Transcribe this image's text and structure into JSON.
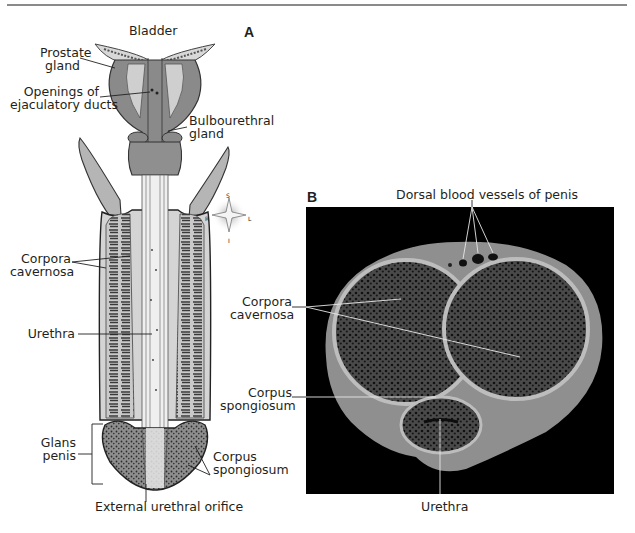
{
  "figure": {
    "panel_a": {
      "letter": "A",
      "labels": {
        "bladder": "Bladder",
        "prostate_1": "Prostate",
        "prostate_2": "gland",
        "openings_1": "Openings of",
        "openings_2": "ejaculatory ducts",
        "bulbo_1": "Bulbourethral",
        "bulbo_2": "gland",
        "corpora_1": "Corpora",
        "corpora_2": "cavernosa",
        "urethra": "Urethra",
        "glans_1": "Glans",
        "glans_2": "penis",
        "spong_1": "Corpus",
        "spong_2": "spongiosum",
        "orifice": "External urethral orifice"
      },
      "compass": {
        "s": "S",
        "i": "I",
        "r": "R",
        "l": "L"
      }
    },
    "panel_b": {
      "letter": "B",
      "labels": {
        "dorsal": "Dorsal blood vessels of penis",
        "corpora_1": "Corpora",
        "corpora_2": "cavernosa",
        "spong_1": "Corpus",
        "spong_2": "spongiosum",
        "urethra": "Urethra"
      }
    }
  },
  "colors": {
    "ink": "#231f20",
    "drawing_fill": "#b9b9b9",
    "drawing_dark": "#6d6d6d",
    "drawing_light": "#e6e6e6",
    "photo_bg": "#000000",
    "tissue": "#9a9a9a"
  }
}
